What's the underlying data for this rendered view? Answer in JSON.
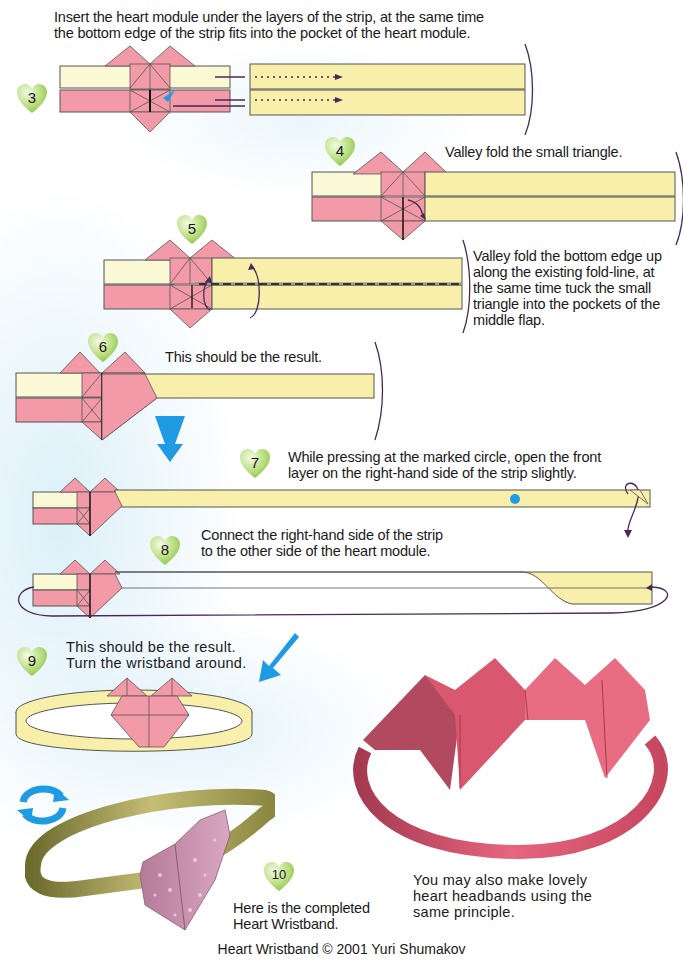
{
  "page": {
    "footer": "Heart Wristband © 2001 Yuri Shumakov"
  },
  "colors": {
    "strip_yellow": "#f7efaa",
    "strip_cream": "#fbf8d6",
    "pink": "#f29aa8",
    "pink_dark": "#e27f90",
    "arrow_blue": "#1e9be3",
    "arrow_purple": "#4a2a55",
    "badge_green": "#a8d468"
  },
  "steps": [
    {
      "number": "3",
      "text_lines": [
        "Insert the heart module under the layers of the strip, at the same time",
        "the bottom edge of the strip fits into the pocket of the heart module."
      ]
    },
    {
      "number": "4",
      "text_lines": [
        "Valley fold the small triangle."
      ]
    },
    {
      "number": "5",
      "text_lines": [
        "Valley fold the bottom edge up",
        "along the existing fold-line, at",
        "the same time tuck the small",
        "triangle into the pockets of the",
        "middle flap."
      ]
    },
    {
      "number": "6",
      "text_lines": [
        "This should be the result."
      ]
    },
    {
      "number": "7",
      "text_lines": [
        "While pressing at the marked circle, open the front",
        "layer on the right-hand side of the strip slightly."
      ]
    },
    {
      "number": "8",
      "text_lines": [
        "Connect the right-hand side of the strip",
        "to the other side of the heart module."
      ]
    },
    {
      "number": "9",
      "text_lines": [
        "This should be the result.",
        "Turn the wristband around."
      ]
    },
    {
      "number": "10",
      "text_lines": [
        "Here is the completed",
        "Heart Wristband."
      ]
    }
  ],
  "extra_note": {
    "text_lines": [
      "You may also make lovely",
      "heart headbands using the",
      "same principle."
    ]
  },
  "icons": {
    "step_badge": "green-heart-icon",
    "turn_over": "rotate-arrows-icon",
    "next_step": "down-arrow-icon"
  }
}
